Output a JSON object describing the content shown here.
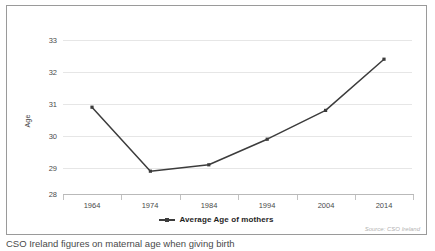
{
  "chart_data": {
    "type": "line",
    "title": "",
    "xlabel": "",
    "ylabel": "Age",
    "categories": [
      "1964",
      "1974",
      "1984",
      "1994",
      "2004",
      "2014"
    ],
    "x": [
      1964,
      1974,
      1984,
      1994,
      2004,
      2014
    ],
    "series": [
      {
        "name": "Average Age of mothers",
        "values": [
          30.9,
          28.9,
          29.1,
          29.9,
          30.8,
          32.4
        ],
        "color": "#3c3c3c"
      }
    ],
    "ylim": [
      28,
      33
    ],
    "yticks": [
      28,
      29,
      30,
      31,
      32,
      33
    ],
    "ytick_labels": [
      "28",
      "29",
      "30",
      "31",
      "32",
      "33"
    ],
    "grid": true,
    "legend_position": "bottom",
    "marker": "square"
  },
  "legend": {
    "entries": [
      {
        "label": "Average Age of mothers",
        "marker": "line-with-square-marker"
      }
    ]
  },
  "source": {
    "text": "Source: CSO Ireland"
  },
  "caption": {
    "text": "CSO Ireland figures on maternal age when giving birth"
  },
  "colors": {
    "line": "#3c3c3c",
    "gridline": "#e6e6e6",
    "axis": "#b9b9b9",
    "frame_border": "#9a9a9a",
    "background": "#ffffff",
    "tick_text": "#4a4a4a",
    "source_text": "#b3b3b3"
  }
}
